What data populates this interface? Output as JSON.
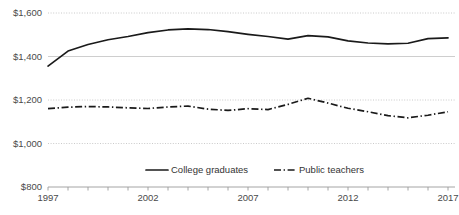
{
  "chart_data": {
    "type": "line",
    "title": "",
    "subtitle": "",
    "xlabel": "",
    "ylabel": "",
    "xlim": [
      1997,
      2017
    ],
    "ylim": [
      800,
      1600
    ],
    "ytick_labels": [
      "$1,600",
      "$1,400",
      "$1,200",
      "$1,000",
      "$800"
    ],
    "ytick_values": [
      1600,
      1400,
      1200,
      1000,
      800
    ],
    "xtick_labels": [
      "1997",
      "2002",
      "2007",
      "2012",
      "2017"
    ],
    "xtick_values": [
      1997,
      2002,
      2007,
      2012,
      2017
    ],
    "x": [
      1997,
      1998,
      1999,
      2000,
      2001,
      2002,
      2003,
      2004,
      2005,
      2006,
      2007,
      2008,
      2009,
      2010,
      2011,
      2012,
      2013,
      2014,
      2015,
      2016,
      2017
    ],
    "grid": "horizontal",
    "legend_position": "bottom",
    "series": [
      {
        "name": "College graduates",
        "style": "solid",
        "color": "#1a1a1a",
        "values": [
          1356,
          1425,
          1455,
          1477,
          1492,
          1510,
          1522,
          1527,
          1524,
          1514,
          1502,
          1492,
          1480,
          1496,
          1490,
          1472,
          1462,
          1458,
          1461,
          1482,
          1486
        ]
      },
      {
        "name": "Public teachers",
        "style": "dash-dot",
        "color": "#1a1a1a",
        "values": [
          1160,
          1167,
          1170,
          1168,
          1164,
          1161,
          1168,
          1172,
          1158,
          1152,
          1160,
          1156,
          1180,
          1208,
          1186,
          1162,
          1146,
          1128,
          1118,
          1130,
          1146
        ]
      }
    ]
  },
  "legend": {
    "items": [
      {
        "label": "College graduates",
        "style": "solid"
      },
      {
        "label": "Public teachers",
        "style": "dash-dot"
      }
    ]
  }
}
